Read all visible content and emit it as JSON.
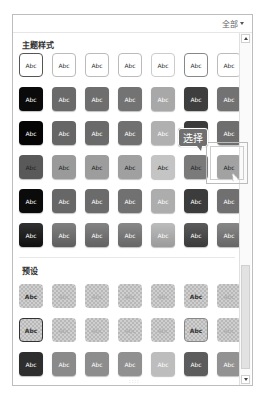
{
  "header": {
    "filter_label": "全部",
    "filter_icon": "dropdown-triangle-icon"
  },
  "sections": [
    {
      "title": "主题样式"
    },
    {
      "title": "预设"
    }
  ],
  "tile_label": "Abc",
  "tooltip": {
    "text": "选择"
  },
  "theme_rows": [
    {
      "style": "outline",
      "fills": [
        "#ffffff",
        "#ffffff",
        "#ffffff",
        "#ffffff",
        "#ffffff",
        "#ffffff",
        "#ffffff"
      ],
      "borders": [
        "#555555",
        "#bbbbbb",
        "#bbbbbb",
        "#bbbbbb",
        "#cccccc",
        "#888888",
        "#bbbbbb"
      ],
      "text": "#333333"
    },
    {
      "style": "solid",
      "fills": [
        "#0a0a0a",
        "#6a6a6a",
        "#6e6e6e",
        "#737373",
        "#a8a8a8",
        "#3e3e3e",
        "#727272"
      ],
      "text": "#ffffff"
    },
    {
      "style": "solid",
      "fills": [
        "#050505",
        "#666666",
        "#6a6a6a",
        "#707070",
        "#b0b0b0",
        "#3a3a3a",
        "#6e6e6e"
      ],
      "text": "#ffffff"
    },
    {
      "style": "light",
      "fills": [
        "#595959",
        "#9a9a9a",
        "#9d9d9d",
        "#a0a0a0",
        "#c4c4c4",
        "#7a7a7a",
        "#a2a2a2"
      ],
      "text": "#222222"
    },
    {
      "style": "solid",
      "fills": [
        "#0b0b0b",
        "#676767",
        "#6b6b6b",
        "#717171",
        "#adadad",
        "#3c3c3c",
        "#707070"
      ],
      "text": "#ffffff"
    },
    {
      "style": "gradient",
      "fills": [
        "#111111",
        "#6c6c6c",
        "#707070",
        "#767676",
        "#b2b2b2",
        "#424242",
        "#757575"
      ],
      "text": "#ffffff"
    }
  ],
  "preset_rows": [
    {
      "style": "checker",
      "borders": [
        "none",
        "none",
        "none",
        "none",
        "none",
        "none",
        "none"
      ],
      "text_dark": [
        true,
        false,
        false,
        false,
        false,
        true,
        false
      ]
    },
    {
      "style": "checker",
      "borders": [
        "#333333",
        "none",
        "none",
        "none",
        "none",
        "#888888",
        "none"
      ],
      "text_dark": [
        true,
        false,
        false,
        false,
        false,
        true,
        false
      ]
    },
    {
      "style": "solid",
      "fills": [
        "#2e2e2e",
        "#8a8a8a",
        "#8d8d8d",
        "#909090",
        "#bdbdbd",
        "#5c5c5c",
        "#929292"
      ],
      "text": "#ffffff"
    }
  ],
  "selected_tile": {
    "row": 3,
    "col": 6
  },
  "grip": "::::"
}
